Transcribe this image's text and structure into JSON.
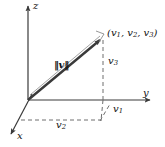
{
  "figure": {
    "background_color": "#ffffff",
    "line_color": "#3a3a3a",
    "dash_color": "#6e6e6e",
    "text_color": "#111111"
  },
  "axes": [
    {
      "name": "z-axis",
      "label": "z",
      "direction": "up"
    },
    {
      "name": "y-axis",
      "label": "y",
      "direction": "right"
    },
    {
      "name": "x-axis",
      "label": "x",
      "direction": "down-left"
    }
  ],
  "labels": {
    "z": "z",
    "y": "y",
    "x": "x",
    "point": "(v",
    "point_sub1": "1",
    "point_mid1": ", v",
    "point_sub2": "2",
    "point_mid2": ", v",
    "point_sub3": "3",
    "point_end": ")",
    "norm_open": "‖",
    "norm_v": "v",
    "norm_close": "‖",
    "v1": "v",
    "v1_sub": "1",
    "v2": "v",
    "v2_sub": "2",
    "v3": "v",
    "v3_sub": "3"
  },
  "geometry": {
    "origin": [
      28,
      100
    ],
    "vector_tip": [
      103,
      38
    ],
    "z_axis_top": [
      28,
      4
    ],
    "y_axis_end": [
      153,
      100
    ],
    "x_axis_end": [
      8,
      138
    ],
    "drop_foot": [
      103,
      100
    ],
    "projection_corner": [
      100,
      120
    ],
    "v2_dash_start": [
      21,
      120
    ]
  }
}
